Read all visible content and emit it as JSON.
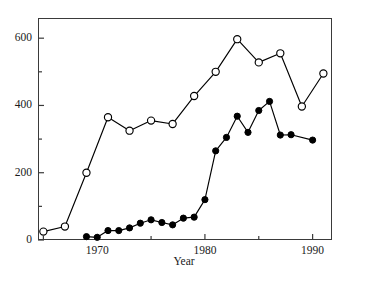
{
  "chart_data": {
    "type": "line",
    "title": "",
    "subtitle": "",
    "xlabel": "Year",
    "ylabel": "",
    "xlim": [
      1964.5,
      1991.8
    ],
    "ylim": [
      0,
      660
    ],
    "grid": false,
    "legend": "none",
    "xticks": [
      1970,
      1980,
      1990
    ],
    "xtick_labels": [
      "1970",
      "1980",
      "1990"
    ],
    "xticks_minor": [
      1965,
      1975,
      1985
    ],
    "yticks": [
      0,
      200,
      400,
      600
    ],
    "ytick_labels": [
      "0",
      "200",
      "400",
      "600"
    ],
    "yticks_minor": [
      100,
      300,
      500
    ],
    "series": [
      {
        "name": "open-circles",
        "marker": "open-circle",
        "color": "#000000",
        "points": [
          {
            "x": 1965,
            "y": 25
          },
          {
            "x": 1967,
            "y": 40
          },
          {
            "x": 1969,
            "y": 200
          },
          {
            "x": 1971,
            "y": 365
          },
          {
            "x": 1973,
            "y": 325
          },
          {
            "x": 1975,
            "y": 355
          },
          {
            "x": 1977,
            "y": 345
          },
          {
            "x": 1979,
            "y": 428
          },
          {
            "x": 1981,
            "y": 500
          },
          {
            "x": 1983,
            "y": 597
          },
          {
            "x": 1985,
            "y": 528
          },
          {
            "x": 1987,
            "y": 555
          },
          {
            "x": 1989,
            "y": 397
          },
          {
            "x": 1991,
            "y": 495
          }
        ]
      },
      {
        "name": "filled-circles",
        "marker": "filled-circle",
        "color": "#000000",
        "points": [
          {
            "x": 1969,
            "y": 10
          },
          {
            "x": 1970,
            "y": 8
          },
          {
            "x": 1971,
            "y": 28
          },
          {
            "x": 1972,
            "y": 28
          },
          {
            "x": 1973,
            "y": 36
          },
          {
            "x": 1974,
            "y": 50
          },
          {
            "x": 1975,
            "y": 60
          },
          {
            "x": 1976,
            "y": 52
          },
          {
            "x": 1977,
            "y": 45
          },
          {
            "x": 1978,
            "y": 65
          },
          {
            "x": 1979,
            "y": 68
          },
          {
            "x": 1980,
            "y": 120
          },
          {
            "x": 1981,
            "y": 265
          },
          {
            "x": 1982,
            "y": 305
          },
          {
            "x": 1983,
            "y": 368
          },
          {
            "x": 1984,
            "y": 320
          },
          {
            "x": 1985,
            "y": 385
          },
          {
            "x": 1986,
            "y": 412
          },
          {
            "x": 1987,
            "y": 312
          },
          {
            "x": 1988,
            "y": 313
          },
          {
            "x": 1990,
            "y": 297
          }
        ]
      }
    ]
  },
  "axis": {
    "x_title": "Year"
  }
}
